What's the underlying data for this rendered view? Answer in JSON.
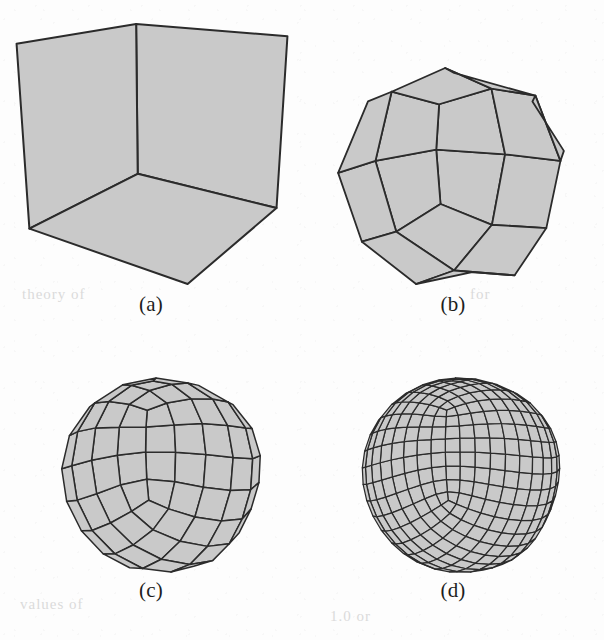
{
  "figure": {
    "kind": "subdivision-surface-sequence",
    "background_color": "#fdfdfd",
    "face_fill_color": "#c9c9c9",
    "edge_color": "#2b2b2b",
    "width": 604,
    "height": 640
  },
  "panels": [
    {
      "id": "a",
      "caption": "(a)",
      "level": 0,
      "description": "control cage: cube with one corner triangulated into a fan",
      "x": 8,
      "y": 18,
      "w": 288,
      "h": 272,
      "caption_y": 292
    },
    {
      "id": "b",
      "caption": "(b)",
      "level": 1,
      "description": "one step of Catmull-Clark subdivision",
      "x": 326,
      "y": 62,
      "w": 250,
      "h": 228,
      "caption_y": 292
    },
    {
      "id": "c",
      "caption": "(c)",
      "level": 2,
      "description": "two steps of Catmull-Clark subdivision",
      "x": 36,
      "y": 372,
      "w": 250,
      "h": 206,
      "caption_y": 578
    },
    {
      "id": "d",
      "caption": "(d)",
      "level": 3,
      "description": "three steps of Catmull-Clark subdivision",
      "x": 336,
      "y": 372,
      "w": 250,
      "h": 206,
      "caption_y": 578
    }
  ],
  "mesh": {
    "comment": "unit cube centred at origin; the +x+y+z corner face is split into a triangle fan so it becomes an extraordinary region",
    "vertices": [
      [
        -1,
        -1,
        -1
      ],
      [
        1,
        -1,
        -1
      ],
      [
        1,
        1,
        -1
      ],
      [
        -1,
        1,
        -1
      ],
      [
        -1,
        -1,
        1
      ],
      [
        1,
        -1,
        1
      ],
      [
        1,
        1,
        1
      ],
      [
        -1,
        1,
        1
      ]
    ],
    "faces": [
      [
        0,
        3,
        2,
        1
      ],
      [
        4,
        5,
        6,
        7
      ],
      [
        0,
        1,
        5,
        4
      ],
      [
        1,
        2,
        6,
        5
      ],
      [
        2,
        3,
        7,
        6
      ],
      [
        3,
        0,
        4,
        7
      ]
    ],
    "triangulated_corner_vertex": 6,
    "triangulated_faces": [
      [
        4,
        5,
        6
      ],
      [
        4,
        6,
        7
      ],
      [
        1,
        2,
        6
      ],
      [
        1,
        6,
        5
      ],
      [
        2,
        3,
        7
      ],
      [
        2,
        7,
        6
      ]
    ]
  },
  "camera": {
    "yaw_degrees": -34,
    "pitch_degrees": 17,
    "projection": "perspective",
    "focal_length": 7.2,
    "distance": 6.4
  },
  "render": {
    "line_width_level_0": 2.0,
    "line_width_level_1": 1.8,
    "line_width_level_2": 1.5,
    "line_width_level_3": 1.25,
    "scale_level_0": 118,
    "scale_level_1": 104,
    "scale_level_2": 104,
    "scale_level_3": 104
  },
  "ghost_text": [
    {
      "text": "theory of",
      "x": 22,
      "y": 286,
      "size": 15
    },
    {
      "text": "for",
      "x": 470,
      "y": 286,
      "size": 15
    },
    {
      "text": "values of",
      "x": 20,
      "y": 596,
      "size": 15
    },
    {
      "text": "1.0 or",
      "x": 330,
      "y": 608,
      "size": 15
    }
  ]
}
